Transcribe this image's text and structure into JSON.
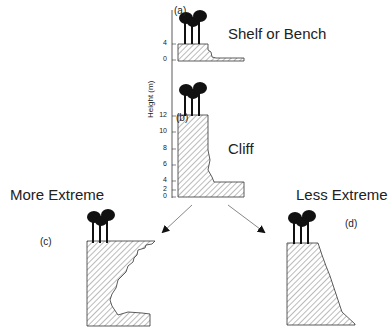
{
  "panels": {
    "a": {
      "label": "(a)",
      "title": "Shelf or Bench"
    },
    "b": {
      "label": "(b)",
      "title": "Cliff"
    },
    "c": {
      "label": "(c)",
      "title": "More Extreme"
    },
    "d": {
      "label": "(d)",
      "title": "Less Extreme"
    }
  },
  "axis": {
    "title": "Height (m)",
    "ticks_a": [
      "4",
      "0"
    ],
    "ticks_b": [
      "12",
      "10",
      "8",
      "6",
      "4",
      "2",
      "0"
    ]
  },
  "colors": {
    "ink": "#222222",
    "hatch": "#555555",
    "arrow": "#888888"
  }
}
